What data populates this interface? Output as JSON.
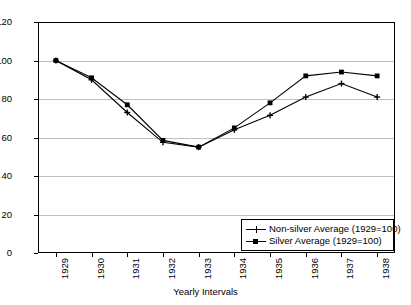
{
  "chart_data": {
    "type": "line",
    "title": "",
    "xlabel": "Yearly Intervals",
    "ylabel": "",
    "categories": [
      "1929",
      "1930",
      "1931",
      "1932",
      "1933",
      "1934",
      "1935",
      "1936",
      "1937",
      "1938"
    ],
    "ylim": [
      0,
      120
    ],
    "yticks": [
      0,
      20,
      40,
      60,
      80,
      100,
      120
    ],
    "grid": "horizontal",
    "legend_position": "bottom-right-inside",
    "series": [
      {
        "name": "Non-silver Average (1929=100)",
        "marker": "cross",
        "color": "#000000",
        "values": [
          100,
          90,
          73,
          57.5,
          55,
          64,
          71.5,
          81,
          88,
          81
        ]
      },
      {
        "name": "Silver Average (1929=100)",
        "marker": "square",
        "color": "#000000",
        "values": [
          100,
          91,
          77,
          58.5,
          55,
          65,
          78,
          92,
          94,
          92
        ]
      }
    ]
  },
  "axis": {
    "y_tick_labels": [
      "0",
      "20",
      "40",
      "60",
      "80",
      "100",
      "120"
    ],
    "x_tick_labels": [
      "1929",
      "1930",
      "1931",
      "1932",
      "1933",
      "1934",
      "1935",
      "1936",
      "1937",
      "1938"
    ],
    "x_axis_title": "Yearly Intervals"
  },
  "legend": {
    "items": [
      {
        "label": "Non-silver Average (1929=100)",
        "marker": "cross-marker"
      },
      {
        "label": "Silver Average (1929=100)",
        "marker": "square-marker"
      }
    ]
  },
  "style": {
    "line_color": "#000000",
    "grid_color": "#bfbfbf",
    "frame_color": "#000000",
    "background": "#ffffff"
  }
}
